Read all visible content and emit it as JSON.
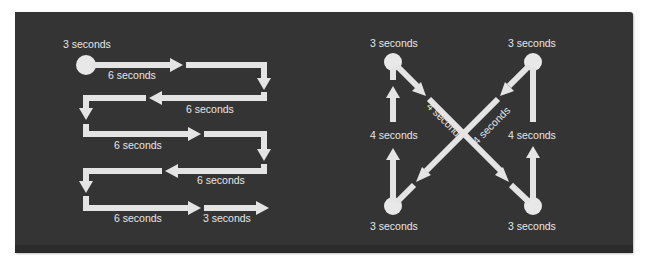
{
  "colors": {
    "panel_background": "#343434",
    "arrow": "#e4e4e4",
    "text": "#e6e6e6"
  },
  "left_diagram": {
    "name": "serpentine-pattern",
    "start_label": "3 seconds",
    "segment_labels": [
      "6 seconds",
      "6 seconds",
      "6 seconds",
      "6 seconds",
      "6 seconds",
      "3 seconds"
    ]
  },
  "right_diagram": {
    "name": "x-pattern",
    "corner_labels": {
      "top_left": "3 seconds",
      "top_right": "3 seconds",
      "bottom_left": "3 seconds",
      "bottom_right": "3 seconds"
    },
    "side_labels": {
      "left": "4 seconds",
      "right": "4 seconds"
    },
    "diagonal_labels": {
      "down_right": "4 seconds",
      "down_left": "4 seconds"
    }
  }
}
